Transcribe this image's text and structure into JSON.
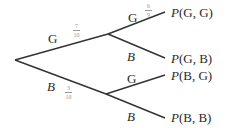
{
  "diagram": {
    "type": "probability-tree",
    "root": {
      "x": 15,
      "y": 60
    },
    "level1": [
      {
        "id": "G",
        "label": "G",
        "label_italic": false,
        "probability": {
          "num": "7",
          "den": "10"
        },
        "node": {
          "x": 108,
          "y": 34
        },
        "children": [
          {
            "id": "GG",
            "label": "G",
            "label_italic": false,
            "probability": {
              "num": "6",
              "den": "9",
              "inferred": true
            },
            "end": {
              "x": 165,
              "y": 12
            },
            "outcome": {
              "prefix": "P",
              "args": "(G, G)"
            }
          },
          {
            "id": "GB",
            "label": "B",
            "label_italic": true,
            "end": {
              "x": 165,
              "y": 58
            },
            "outcome": {
              "prefix": "P",
              "args": "(G, B)"
            }
          }
        ]
      },
      {
        "id": "B",
        "label": "B",
        "label_italic": true,
        "probability": {
          "num": "3",
          "den": "10",
          "inferred": true
        },
        "node": {
          "x": 106,
          "y": 94
        },
        "children": [
          {
            "id": "BG",
            "label": "G",
            "label_italic": false,
            "end": {
              "x": 165,
              "y": 75
            },
            "outcome": {
              "prefix": "P",
              "args": "(B, G)"
            }
          },
          {
            "id": "BB",
            "label": "B",
            "label_italic": true,
            "end": {
              "x": 165,
              "y": 118
            },
            "outcome": {
              "prefix": "P",
              "args": "(B, B)"
            }
          }
        ]
      }
    ],
    "colors": {
      "line": "#333333",
      "text": "#2a2a2a",
      "fraction": "#9a9a9a",
      "background": "#ffffff"
    }
  }
}
